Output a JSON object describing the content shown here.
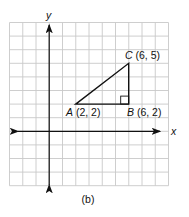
{
  "figure": {
    "caption": "(b)",
    "axes": {
      "x_label": "x",
      "y_label": "y"
    },
    "grid": {
      "cols": 12,
      "rows": 12,
      "origin_col": 3,
      "origin_row": 8
    },
    "points": [
      {
        "name": "A",
        "coords": "(2, 2)",
        "x": 2,
        "y": 2
      },
      {
        "name": "B",
        "coords": "(6, 2)",
        "x": 6,
        "y": 2
      },
      {
        "name": "C",
        "coords": "(6, 5)",
        "x": 6,
        "y": 5
      }
    ],
    "right_angle_at": "B",
    "colors": {
      "grid": "#c8c8c8",
      "ink": "#111111"
    }
  }
}
